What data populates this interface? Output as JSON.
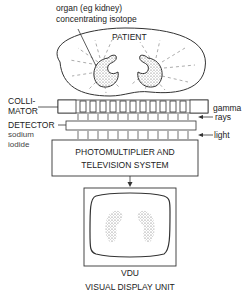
{
  "diagram": {
    "organ_label_line1": "organ (eg kidney)",
    "organ_label_line2": "concentrating isotope",
    "patient_label": "PATIENT",
    "collimator_line1": "COLLI-",
    "collimator_line2": "MATOR",
    "gamma_line1": "gamma",
    "gamma_line2": "rays",
    "detector_label": "DETECTOR",
    "detector_sub1": "sodium",
    "detector_sub2": "iodide",
    "light_label": "light",
    "photomultiplier_line1": "PHOTOMULTIPLIER AND",
    "photomultiplier_line2": "TELEVISION SYSTEM",
    "vdu_label": "VDU",
    "vdu_full": "VISUAL DISPLAY UNIT"
  }
}
